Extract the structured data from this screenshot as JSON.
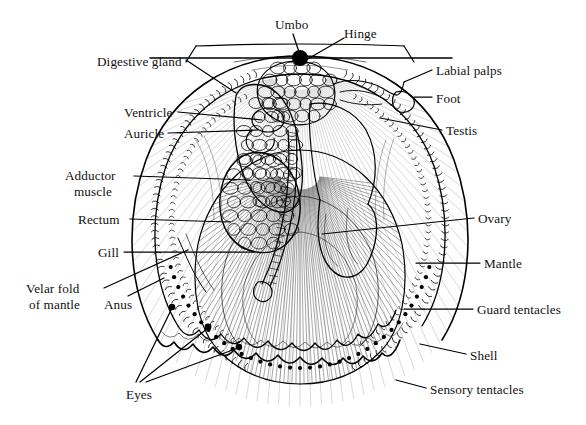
{
  "figure": {
    "top_note": "",
    "background_color": "#ffffff",
    "ink_color": "#000000",
    "label_font_size_px": 13
  },
  "labels": [
    {
      "id": "umbo",
      "text": "Umbo",
      "x": 275,
      "y": 18,
      "align": "left"
    },
    {
      "id": "hinge",
      "text": "Hinge",
      "x": 344,
      "y": 27,
      "align": "left"
    },
    {
      "id": "digestive-gland",
      "text": "Digestive gland",
      "x": 97,
      "y": 55,
      "align": "left"
    },
    {
      "id": "labial-palps",
      "text": "Labial palps",
      "x": 436,
      "y": 64,
      "align": "left"
    },
    {
      "id": "foot",
      "text": "Foot",
      "x": 436,
      "y": 92,
      "align": "left"
    },
    {
      "id": "ventricle",
      "text": "Ventricle",
      "x": 124,
      "y": 106,
      "align": "left"
    },
    {
      "id": "auricle",
      "text": "Auricle",
      "x": 124,
      "y": 127,
      "align": "left"
    },
    {
      "id": "testis",
      "text": "Testis",
      "x": 446,
      "y": 124,
      "align": "left"
    },
    {
      "id": "adductor-muscle-1",
      "text": "Adductor",
      "x": 65,
      "y": 169,
      "align": "left"
    },
    {
      "id": "adductor-muscle-2",
      "text": "muscle",
      "x": 74,
      "y": 185,
      "align": "left"
    },
    {
      "id": "rectum",
      "text": "Rectum",
      "x": 78,
      "y": 213,
      "align": "left"
    },
    {
      "id": "ovary",
      "text": "Ovary",
      "x": 478,
      "y": 212,
      "align": "left"
    },
    {
      "id": "gill",
      "text": "Gill",
      "x": 98,
      "y": 246,
      "align": "left"
    },
    {
      "id": "mantle",
      "text": "Mantle",
      "x": 484,
      "y": 257,
      "align": "left"
    },
    {
      "id": "velar-fold-1",
      "text": "Velar fold",
      "x": 26,
      "y": 282,
      "align": "left"
    },
    {
      "id": "velar-fold-2",
      "text": "of mantle",
      "x": 29,
      "y": 298,
      "align": "left"
    },
    {
      "id": "anus",
      "text": "Anus",
      "x": 104,
      "y": 298,
      "align": "left"
    },
    {
      "id": "guard-tentacles",
      "text": "Guard tentacles",
      "x": 477,
      "y": 303,
      "align": "left"
    },
    {
      "id": "shell",
      "text": "Shell",
      "x": 470,
      "y": 349,
      "align": "left"
    },
    {
      "id": "eyes",
      "text": "Eyes",
      "x": 126,
      "y": 388,
      "align": "left"
    },
    {
      "id": "sensory-tentacles",
      "text": "Sensory tentacles",
      "x": 430,
      "y": 383,
      "align": "left"
    }
  ],
  "leader_lines": [
    {
      "id": "leader-umbo",
      "points": "293,34 300,55"
    },
    {
      "id": "leader-hinge",
      "points": "344,38 306,60"
    },
    {
      "id": "leader-digestive-gland",
      "points": "186,60 236,93"
    },
    {
      "id": "leader-labial-palps",
      "points": "432,70 404,82"
    },
    {
      "id": "leader-foot",
      "points": "432,97 414,97"
    },
    {
      "id": "leader-ventricle",
      "points": "178,112 262,120"
    },
    {
      "id": "leader-auricle",
      "points": "168,133 258,130"
    },
    {
      "id": "leader-testis",
      "points": "442,130 380,118"
    },
    {
      "id": "leader-adductor-muscle",
      "points": "134,176 250,180"
    },
    {
      "id": "leader-rectum",
      "points": "130,219 230,222"
    },
    {
      "id": "leader-ovary",
      "points": "474,218 322,234"
    },
    {
      "id": "leader-gill",
      "points": "124,252 254,252"
    },
    {
      "id": "leader-mantle",
      "points": "480,263 416,263"
    },
    {
      "id": "leader-velar-fold",
      "points": "104,288 188,250"
    },
    {
      "id": "leader-anus",
      "points": "128,296 164,278"
    },
    {
      "id": "leader-guard-tentacles",
      "points": "473,309 404,309"
    },
    {
      "id": "leader-shell",
      "points": "466,354 420,344"
    },
    {
      "id": "leader-sensory-tentacles",
      "points": "426,388 396,380"
    },
    {
      "id": "leader-eyes-a",
      "points": "136,382 172,308"
    },
    {
      "id": "leader-eyes-b",
      "points": "140,382 208,328"
    },
    {
      "id": "leader-eyes-c",
      "points": "146,382 238,348"
    }
  ],
  "markers": [
    {
      "id": "umbo-dot",
      "cx": 300,
      "cy": 58,
      "r": 8
    },
    {
      "id": "eye-dot-1",
      "cx": 172,
      "cy": 307,
      "r": 3.2
    },
    {
      "id": "eye-dot-2",
      "cx": 208,
      "cy": 327,
      "r": 3.4
    },
    {
      "id": "eye-dot-3",
      "cx": 239,
      "cy": 347,
      "r": 3.2
    }
  ],
  "structures": [
    {
      "id": "shell-outline",
      "label": "Shell"
    },
    {
      "id": "hinge-line",
      "label": "Hinge"
    },
    {
      "id": "mantle-edge",
      "label": "Mantle"
    },
    {
      "id": "gill-filaments",
      "label": "Gill"
    },
    {
      "id": "adductor-muscle",
      "label": "Adductor muscle"
    },
    {
      "id": "digestive-gland",
      "label": "Digestive gland"
    },
    {
      "id": "gonad-testis",
      "label": "Testis"
    },
    {
      "id": "gonad-ovary",
      "label": "Ovary"
    },
    {
      "id": "heart-ventricle",
      "label": "Ventricle"
    },
    {
      "id": "heart-auricle",
      "label": "Auricle"
    },
    {
      "id": "labial-palps",
      "label": "Labial palps"
    },
    {
      "id": "foot",
      "label": "Foot"
    },
    {
      "id": "rectum",
      "label": "Rectum"
    },
    {
      "id": "anus",
      "label": "Anus"
    },
    {
      "id": "velar-fold",
      "label": "Velar fold of mantle"
    },
    {
      "id": "guard-tentacles",
      "label": "Guard tentacles"
    },
    {
      "id": "sensory-tentacles",
      "label": "Sensory tentacles"
    },
    {
      "id": "eyes",
      "label": "Eyes"
    }
  ]
}
